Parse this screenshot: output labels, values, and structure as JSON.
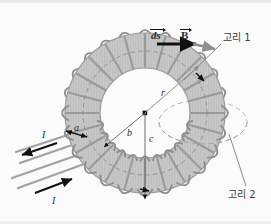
{
  "figure": {
    "background_color": "#fbfbfb",
    "labels": {
      "ds": "ds",
      "b_field": "B",
      "loop1": "고리 1",
      "loop2": "고리 2",
      "radius_b": "b",
      "radius_c": "c",
      "radius_r": "r",
      "coil_width": "a",
      "current_out": "I",
      "current_in": "I"
    },
    "colors": {
      "core_fill": "#c9c9c9",
      "core_hatch": "#b4b4b4",
      "coil_stroke": "#8c8c8c",
      "spoke_stroke": "#9a9a9a",
      "wire_stroke": "#9e9e9e",
      "arrow_black": "#111111",
      "dashed_loop": "#a8a8a8",
      "leader_line": "#8a8a8a",
      "text": "#2b2b2b"
    },
    "geometry": {
      "center_x": 145,
      "center_y": 113,
      "inner_radius": 45,
      "outer_radius": 80,
      "coil_turns": 24,
      "loop2_center_x": 203,
      "loop2_center_y": 122,
      "loop2_rx": 44,
      "loop2_ry": 22
    }
  }
}
